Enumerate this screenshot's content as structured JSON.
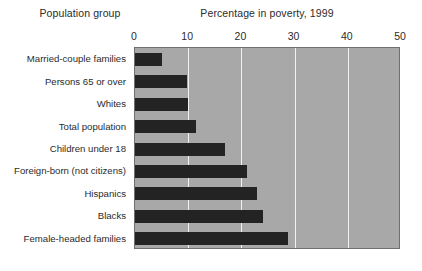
{
  "headers": {
    "group": "Population group",
    "value": "Percentage in poverty, 1999"
  },
  "colors": {
    "plot_background": "#a8a8a8",
    "bar": "#232323",
    "gridline": "#f2f2f2",
    "page_background": "#ffffff",
    "frame": "#6f6f6f"
  },
  "chart_data": {
    "type": "bar",
    "orientation": "horizontal",
    "title": "Percentage in poverty, 1999",
    "xlabel": "Percentage in poverty, 1999",
    "ylabel": "Population group",
    "xlim": [
      0,
      50
    ],
    "ticks": [
      0,
      10,
      20,
      30,
      40,
      50
    ],
    "tick_labels": [
      "0",
      "10",
      "20",
      "30",
      "40",
      "50"
    ],
    "grid": true,
    "legend": "none",
    "categories": [
      "Married-couple families",
      "Persons 65 or over",
      "Whites",
      "Total population",
      "Children under 18",
      "Foreign-born (not citizens)",
      "Hispanics",
      "Blacks",
      "Female-headed families"
    ],
    "values": [
      5.1,
      9.7,
      10.0,
      11.5,
      17.0,
      21.0,
      23.0,
      24.0,
      28.8
    ]
  }
}
